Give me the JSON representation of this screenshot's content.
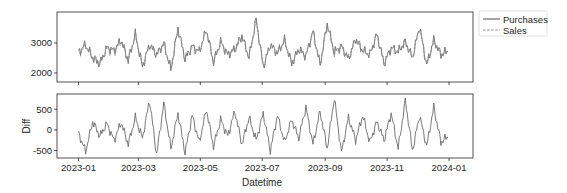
{
  "chart_data": [
    {
      "type": "line",
      "panel": "top",
      "title": "",
      "xlabel": "",
      "ylabel": "",
      "x_range": [
        "2023-01-01",
        "2023-12-31"
      ],
      "ylim": [
        1700,
        4030
      ],
      "yticks": [
        2000,
        3000
      ],
      "ytick_labels": [
        "2000",
        "3000"
      ],
      "grid": false,
      "legend": {
        "placement": "outside-top-right",
        "entries": [
          {
            "label": "Purchases",
            "style": "solid"
          },
          {
            "label": "Sales",
            "style": "dashed"
          }
        ]
      },
      "x_frequency": "weekly-approx (daily series in source)",
      "series": [
        {
          "name": "Purchases",
          "color": "#6b6b6b",
          "style": "solid",
          "values": [
            2700,
            2950,
            2500,
            2300,
            2850,
            2750,
            3100,
            2400,
            3300,
            2200,
            2950,
            2600,
            3000,
            2100,
            3500,
            2450,
            2900,
            2700,
            3450,
            2350,
            3050,
            2600,
            2800,
            3250,
            2500,
            3800,
            2200,
            2950,
            2650,
            3100,
            2300,
            2800,
            2550,
            3400,
            2250,
            3650,
            2700,
            2900,
            2450,
            3150,
            2750,
            2600,
            3300,
            2300,
            2850,
            2700,
            3050,
            2500,
            3550,
            2250,
            3100,
            2600,
            2750
          ]
        },
        {
          "name": "Sales",
          "color": "#8a8a8a",
          "style": "dashed",
          "values": [
            2650,
            2900,
            2550,
            2350,
            2800,
            2700,
            3050,
            2450,
            3250,
            2250,
            2900,
            2650,
            2950,
            2150,
            3450,
            2500,
            2850,
            2750,
            3400,
            2400,
            3000,
            2650,
            2750,
            3200,
            2550,
            3750,
            2250,
            2900,
            2700,
            3050,
            2350,
            2750,
            2600,
            3350,
            2300,
            3600,
            2650,
            2850,
            2500,
            3100,
            2700,
            2650,
            3250,
            2350,
            2800,
            2750,
            3000,
            2550,
            3500,
            2300,
            3050,
            2650,
            2700
          ]
        }
      ]
    },
    {
      "type": "line",
      "panel": "bottom",
      "title": "",
      "xlabel": "Datetime",
      "ylabel": "Diff",
      "x_range": [
        "2023-01-01",
        "2023-12-31"
      ],
      "ylim": [
        -680,
        870
      ],
      "yticks": [
        -500,
        0,
        500
      ],
      "ytick_labels": [
        "-500",
        "0",
        "500"
      ],
      "xticks": [
        "2023-01-01",
        "2023-03-01",
        "2023-05-01",
        "2023-07-01",
        "2023-09-01",
        "2023-11-01",
        "2024-01-01"
      ],
      "xtick_labels": [
        "2023-01",
        "2023-03",
        "2023-05",
        "2023-07",
        "2023-09",
        "2023-11",
        "2024-01"
      ],
      "grid": false,
      "x_frequency": "weekly-approx (daily series in source)",
      "series": [
        {
          "name": "Diff",
          "color": "#6b6b6b",
          "style": "solid",
          "values": [
            -80,
            -520,
            200,
            -150,
            150,
            -250,
            180,
            -350,
            300,
            -200,
            720,
            -600,
            650,
            -450,
            400,
            -550,
            350,
            -300,
            500,
            -400,
            250,
            -150,
            450,
            -350,
            300,
            -250,
            400,
            -500,
            350,
            -300,
            250,
            -200,
            550,
            -350,
            450,
            -450,
            780,
            -550,
            300,
            -250,
            350,
            -300,
            200,
            -250,
            400,
            -450,
            720,
            -500,
            350,
            -400,
            550,
            -300,
            -150
          ]
        }
      ]
    }
  ]
}
